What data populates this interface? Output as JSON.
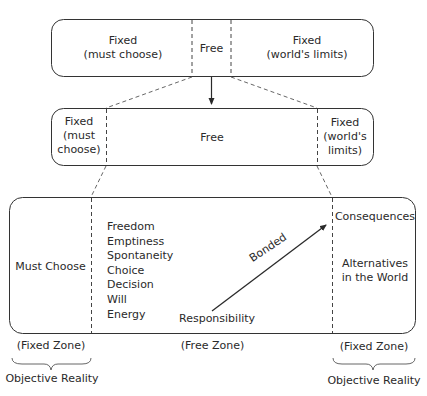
{
  "top_box": {
    "left": {
      "line1": "Fixed",
      "line2": "(must choose)"
    },
    "center": "Free",
    "right": {
      "line1": "Fixed",
      "line2": "(world's limits)"
    }
  },
  "middle_box": {
    "left": {
      "line1": "Fixed",
      "line2": "(must",
      "line3": "choose)"
    },
    "center": "Free",
    "right": {
      "line1": "Fixed",
      "line2": "(world's",
      "line3": "limits)"
    }
  },
  "bottom_box": {
    "left": "Must Choose",
    "free_list": [
      "Freedom",
      "Emptiness",
      "Spontaneity",
      "Choice",
      "Decision",
      "Will",
      "Energy"
    ],
    "arrow_start_label": "Responsibility",
    "arrow_label": "Bonded",
    "right_top": "Consequences",
    "right_bottom": {
      "line1": "Alternatives",
      "line2": "in the World"
    }
  },
  "zones": {
    "left": "(Fixed Zone)",
    "center": "(Free Zone)",
    "right": "(Fixed Zone)"
  },
  "braces": {
    "left": "Objective Reality",
    "right": "Objective Reality"
  }
}
